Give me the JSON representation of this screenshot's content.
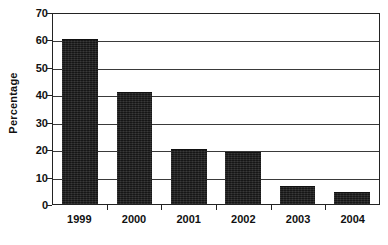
{
  "chart_data": {
    "type": "bar",
    "title": "",
    "xlabel": "",
    "ylabel": "Percentage",
    "categories": [
      "1999",
      "2000",
      "2001",
      "2002",
      "2003",
      "2004"
    ],
    "values": [
      60,
      41,
      20,
      19,
      6.5,
      4.5
    ],
    "ylim": [
      0,
      70
    ],
    "ytick_labels": [
      "70",
      "60",
      "50",
      "40",
      "30",
      "20",
      "10",
      "0"
    ],
    "ytick_values": [
      70,
      60,
      50,
      40,
      30,
      20,
      10,
      0
    ],
    "ytick_step": 10,
    "grid": true,
    "grid_axis": "y",
    "legend": false,
    "legend_position": "none",
    "bar_color": "#1f1f1f",
    "grid_color": "#3a3a3a",
    "axis_color": "#232323",
    "background_color": "#ffffff",
    "text_color": "#111111"
  }
}
